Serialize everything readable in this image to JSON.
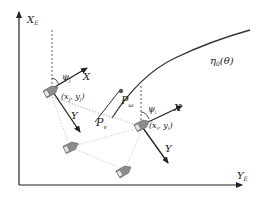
{
  "axes": {
    "vertical_label": "X",
    "vertical_sub": "E",
    "horizontal_label": "Y",
    "horizontal_sub": "E"
  },
  "path": {
    "label": "η",
    "label_sub": "0",
    "label_arg": "(θ)"
  },
  "points": {
    "virtual_label": "P",
    "virtual_sub": "v",
    "omega_label": "P",
    "omega_sub": "ω"
  },
  "vessels": [
    {
      "id": "j",
      "position_label": "(x",
      "position_sub_x": "j",
      "position_mid": ", y",
      "position_sub_y": "j",
      "position_end": ")",
      "heading_label": "ψ",
      "heading_sub": "j",
      "body_x_label": "X",
      "body_y_label": "Y"
    },
    {
      "id": "i",
      "position_label": "(x",
      "position_sub_x": "i",
      "position_mid": ", y",
      "position_sub_y": "i",
      "position_end": ")",
      "heading_label": "ψ",
      "heading_sub": "i",
      "body_x_label": "X",
      "body_y_label": "Y"
    }
  ],
  "colors": {
    "line": "#222222",
    "ship_fill": "#8c8c8c",
    "ship_light": "#e6e6e6",
    "dotted": "#b0b0b0"
  }
}
